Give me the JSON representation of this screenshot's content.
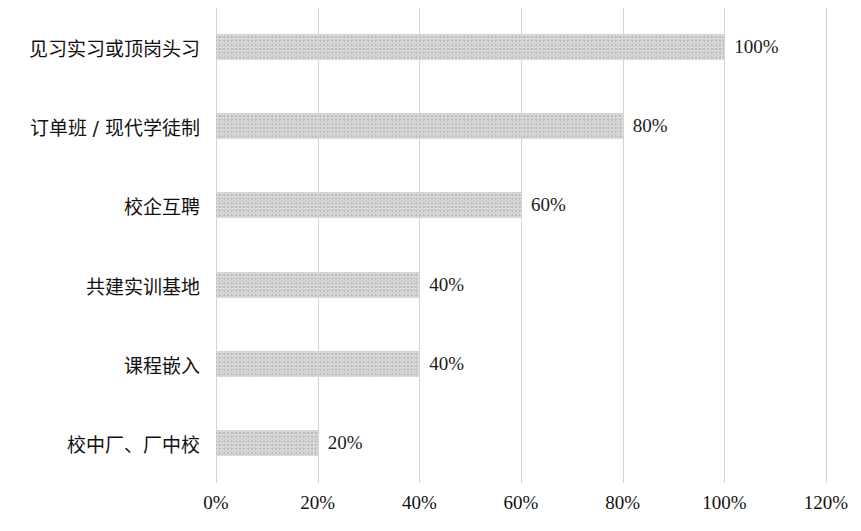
{
  "chart_data": {
    "type": "bar",
    "orientation": "horizontal",
    "title": "",
    "subtitle": "",
    "xlabel": "",
    "ylabel": "",
    "xlim": [
      0,
      120
    ],
    "grid": true,
    "legend": null,
    "legend_position": "none",
    "bar_color": "#d2d2d2",
    "gridline_color": "#d4d4d4",
    "text_color": "#111111",
    "background": "#ffffff",
    "categories": [
      "见习实习或顶岗头习",
      "订单班 / 现代学徒制",
      "校企互聘",
      "共建实训基地",
      "课程嵌入",
      "校中厂、厂中校"
    ],
    "values": [
      100,
      80,
      60,
      40,
      40,
      20
    ],
    "data_labels": [
      "100%",
      "80%",
      "60%",
      "40%",
      "40%",
      "20%"
    ],
    "xticks": [
      0,
      20,
      40,
      60,
      80,
      100,
      120
    ],
    "xticklabels": [
      "0%",
      "20%",
      "40%",
      "60%",
      "80%",
      "100%",
      "120%"
    ]
  }
}
